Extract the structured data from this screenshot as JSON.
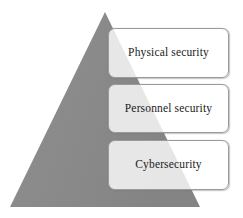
{
  "diagram": {
    "type": "pyramid",
    "title": "",
    "background_color": "#ffffff",
    "shape": {
      "name": "security-pyramid",
      "fill_color": "#898989",
      "apex": {
        "x": 105,
        "y": 12
      },
      "base_left": {
        "x": 10,
        "y": 207
      },
      "base_right": {
        "x": 200,
        "y": 207
      }
    },
    "layers": [
      {
        "id": "physical",
        "label": "Physical security",
        "order": 1,
        "box_fill": "#ffffff",
        "box_border": "#9a9a9a",
        "text_color": "#1b1b1b"
      },
      {
        "id": "personnel",
        "label": "Personnel security",
        "order": 2,
        "box_fill": "#ffffff",
        "box_border": "#9a9a9a",
        "text_color": "#1b1b1b"
      },
      {
        "id": "cybersecurity",
        "label": "Cybersecurity",
        "order": 3,
        "box_fill": "#ffffff",
        "box_border": "#9a9a9a",
        "text_color": "#1b1b1b"
      }
    ]
  }
}
